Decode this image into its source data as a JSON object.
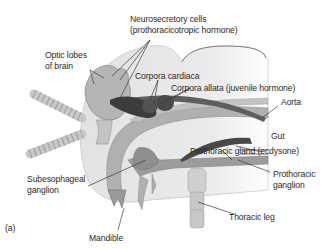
{
  "figure": {
    "panel_label": "(a)"
  },
  "labels": {
    "neurosecretory_line1": "Neurosecretory cells",
    "neurosecretory_line2": "(prothoracicotropic hormone)",
    "optic_line1": "Optic lobes",
    "optic_line2": "of brain",
    "corpora_cardiaca": "Corpora cardiaca",
    "corpora_allata": "Corpora allata (juvenile hormone)",
    "aorta": "Aorta",
    "gut": "Gut",
    "prothoracic_gland": "Prothoracic gland (ecdysone)",
    "subesophageal_line1": "Subesophageal",
    "subesophageal_line2": "ganglion",
    "prothoracic_ganglion_line1": "Prothoracic",
    "prothoracic_ganglion_line2": "ganglion",
    "mandible": "Mandible",
    "thoracic_leg": "Thoracic leg"
  },
  "colors": {
    "head_fill": "#e6e6e6",
    "tissue": "#a9a9a9",
    "dark_structure": "#3c3c3c",
    "aorta": "#5e5e5e",
    "leader_line": "#3a3a3a",
    "text": "#2a2a2a"
  }
}
